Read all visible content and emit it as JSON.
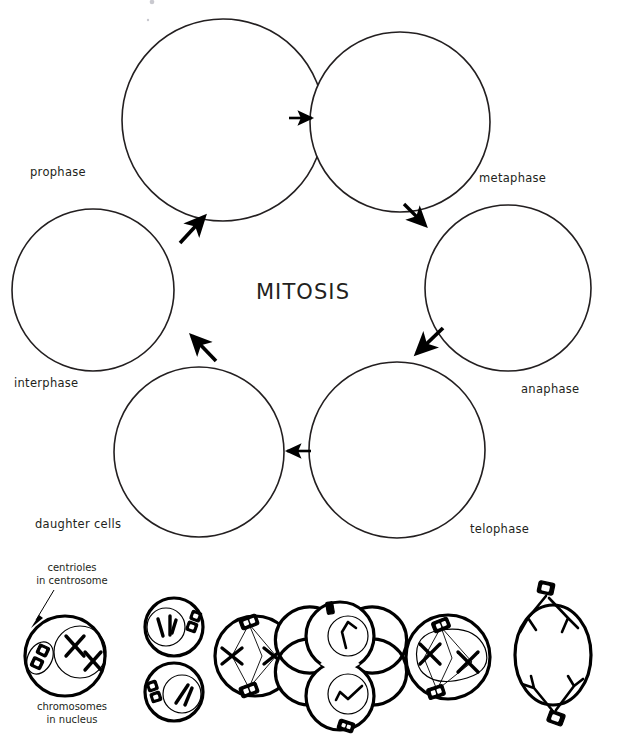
{
  "diagram": {
    "title": "MITOSIS",
    "type": "cell-cycle-diagram",
    "cycle_phases": [
      {
        "id": "prophase",
        "label": "prophase",
        "order": 2,
        "cx": 223,
        "cy": 120,
        "r": 101,
        "label_x": 30,
        "label_y": 176
      },
      {
        "id": "metaphase",
        "label": "metaphase",
        "order": 3,
        "cx": 400,
        "cy": 122,
        "r": 90,
        "label_x": 479,
        "label_y": 182
      },
      {
        "id": "anaphase",
        "label": "anaphase",
        "order": 4,
        "cx": 508,
        "cy": 288,
        "r": 83,
        "label_x": 522,
        "label_y": 393
      },
      {
        "id": "telophase",
        "label": "telophase",
        "order": 5,
        "cx": 397,
        "cy": 450,
        "r": 88,
        "label_x": 470,
        "label_y": 533
      },
      {
        "id": "daughter",
        "label": "daughter  cells",
        "order": 6,
        "cx": 199,
        "cy": 452,
        "r": 85,
        "label_x": 35,
        "label_y": 528
      },
      {
        "id": "interphase",
        "label": "interphase",
        "order": 1,
        "cx": 93,
        "cy": 290,
        "r": 81,
        "label_x": 14,
        "label_y": 387
      }
    ],
    "arrows": [
      {
        "from": "prophase",
        "to": "metaphase",
        "x1": 291,
        "y1": 118,
        "x2": 318,
        "y2": 118
      },
      {
        "from": "metaphase",
        "to": "anaphase",
        "x1": 404,
        "y1": 203,
        "x2": 430,
        "y2": 228
      },
      {
        "from": "anaphase",
        "to": "telophase",
        "x1": 440,
        "y1": 330,
        "x2": 413,
        "y2": 356
      },
      {
        "from": "telophase",
        "to": "daughter",
        "x1": 311,
        "y1": 451,
        "x2": 283,
        "y2": 451
      },
      {
        "from": "daughter",
        "to": "interphase",
        "x1": 215,
        "y1": 360,
        "x2": 190,
        "y2": 334
      },
      {
        "from": "interphase",
        "to": "prophase",
        "x1": 178,
        "y1": 243,
        "x2": 205,
        "y2": 216
      }
    ],
    "callouts": [
      {
        "id": "centrioles",
        "lines": [
          "centrioles",
          "in centrosome"
        ],
        "text": "centrioles in centrosome",
        "anchor_x": 72,
        "anchor_y": 573,
        "points_to": "centriole pair in interphase cell"
      },
      {
        "id": "chromosomes",
        "lines": [
          "chromosomes",
          "in nucleus"
        ],
        "text": "chromosomes in nucleus",
        "anchor_x": 72,
        "anchor_y": 712,
        "points_to": "chromosomes inside nucleus of interphase cell"
      }
    ],
    "stage_cells": [
      {
        "id": "stage-interphase",
        "order": 1,
        "description": "round cell with nucleus containing X-shaped chromosomes and a pair of centrioles"
      },
      {
        "id": "stage-prophase-a",
        "order": 2,
        "description": "cell with condensing chromosomes in nucleus, centriole pair at right"
      },
      {
        "id": "stage-prophase-b",
        "order": 3,
        "description": "cell with chromosomes in nucleus, centriole pair at left"
      },
      {
        "id": "stage-metaphase",
        "order": 4,
        "description": "cell with two centrosomes at poles, spindle fibers, chromosomes aligned at equator"
      },
      {
        "id": "stage-telophase",
        "order": 5,
        "description": "figure-eight dividing cell with two nuclei and centrioles at poles"
      },
      {
        "id": "stage-anaphase",
        "order": 6,
        "description": "cell with nuclear envelope breaking down, chromosomes on spindle between two centrosomes"
      },
      {
        "id": "stage-separation",
        "order": 7,
        "description": "oval cell with chromatids pulled toward opposite centrosome poles"
      }
    ],
    "colors": {
      "ink": "#231f20",
      "outline": "#000000",
      "background": "#ffffff"
    }
  }
}
